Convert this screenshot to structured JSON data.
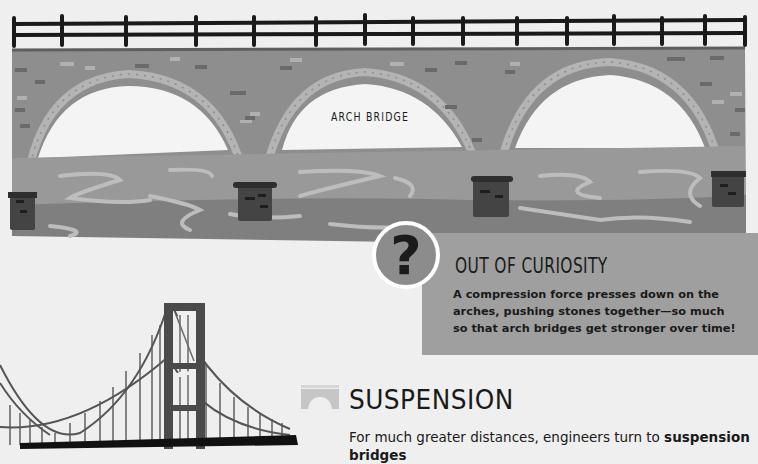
{
  "arch_illustration": {
    "label": "ARCH BRIDGE",
    "colors": {
      "background": "#efefef",
      "railing": "#1a1a1a",
      "stone": "#8e8e8e",
      "arch_opening": "#f4f4f4",
      "water": "#999999",
      "water_dark": "#7f7f7f",
      "pier": "#444444"
    }
  },
  "curiosity": {
    "badge_icon": "question-mark-icon",
    "badge_glyph": "?",
    "title": "OUT OF CURIOSITY",
    "body_lines": [
      "A compression force presses down on the",
      "arches, pushing stones together—so much",
      "so that arch bridges get stronger over time!"
    ],
    "colors": {
      "box": "#9f9f9f",
      "badge": "#8c8c8c",
      "badge_border": "#ffffff"
    }
  },
  "suspension_section": {
    "icon": "arch-bridge-small-icon",
    "title": "SUSPENSION",
    "body_prefix": "For much greater distances, engineers turn to ",
    "body_bold": "suspension",
    "body_line2": "bridges"
  }
}
